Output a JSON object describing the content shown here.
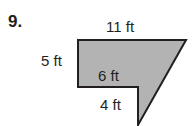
{
  "problem": {
    "number": "9.",
    "labels": {
      "top": "11 ft",
      "left": "5 ft",
      "inner_horizontal": "6 ft",
      "inner_vertical": "4 ft"
    },
    "shape": {
      "fill": "#b3b3b3",
      "stroke": "#231f20",
      "points": "78,40 186,40 138,125 138,87 78,87"
    }
  }
}
